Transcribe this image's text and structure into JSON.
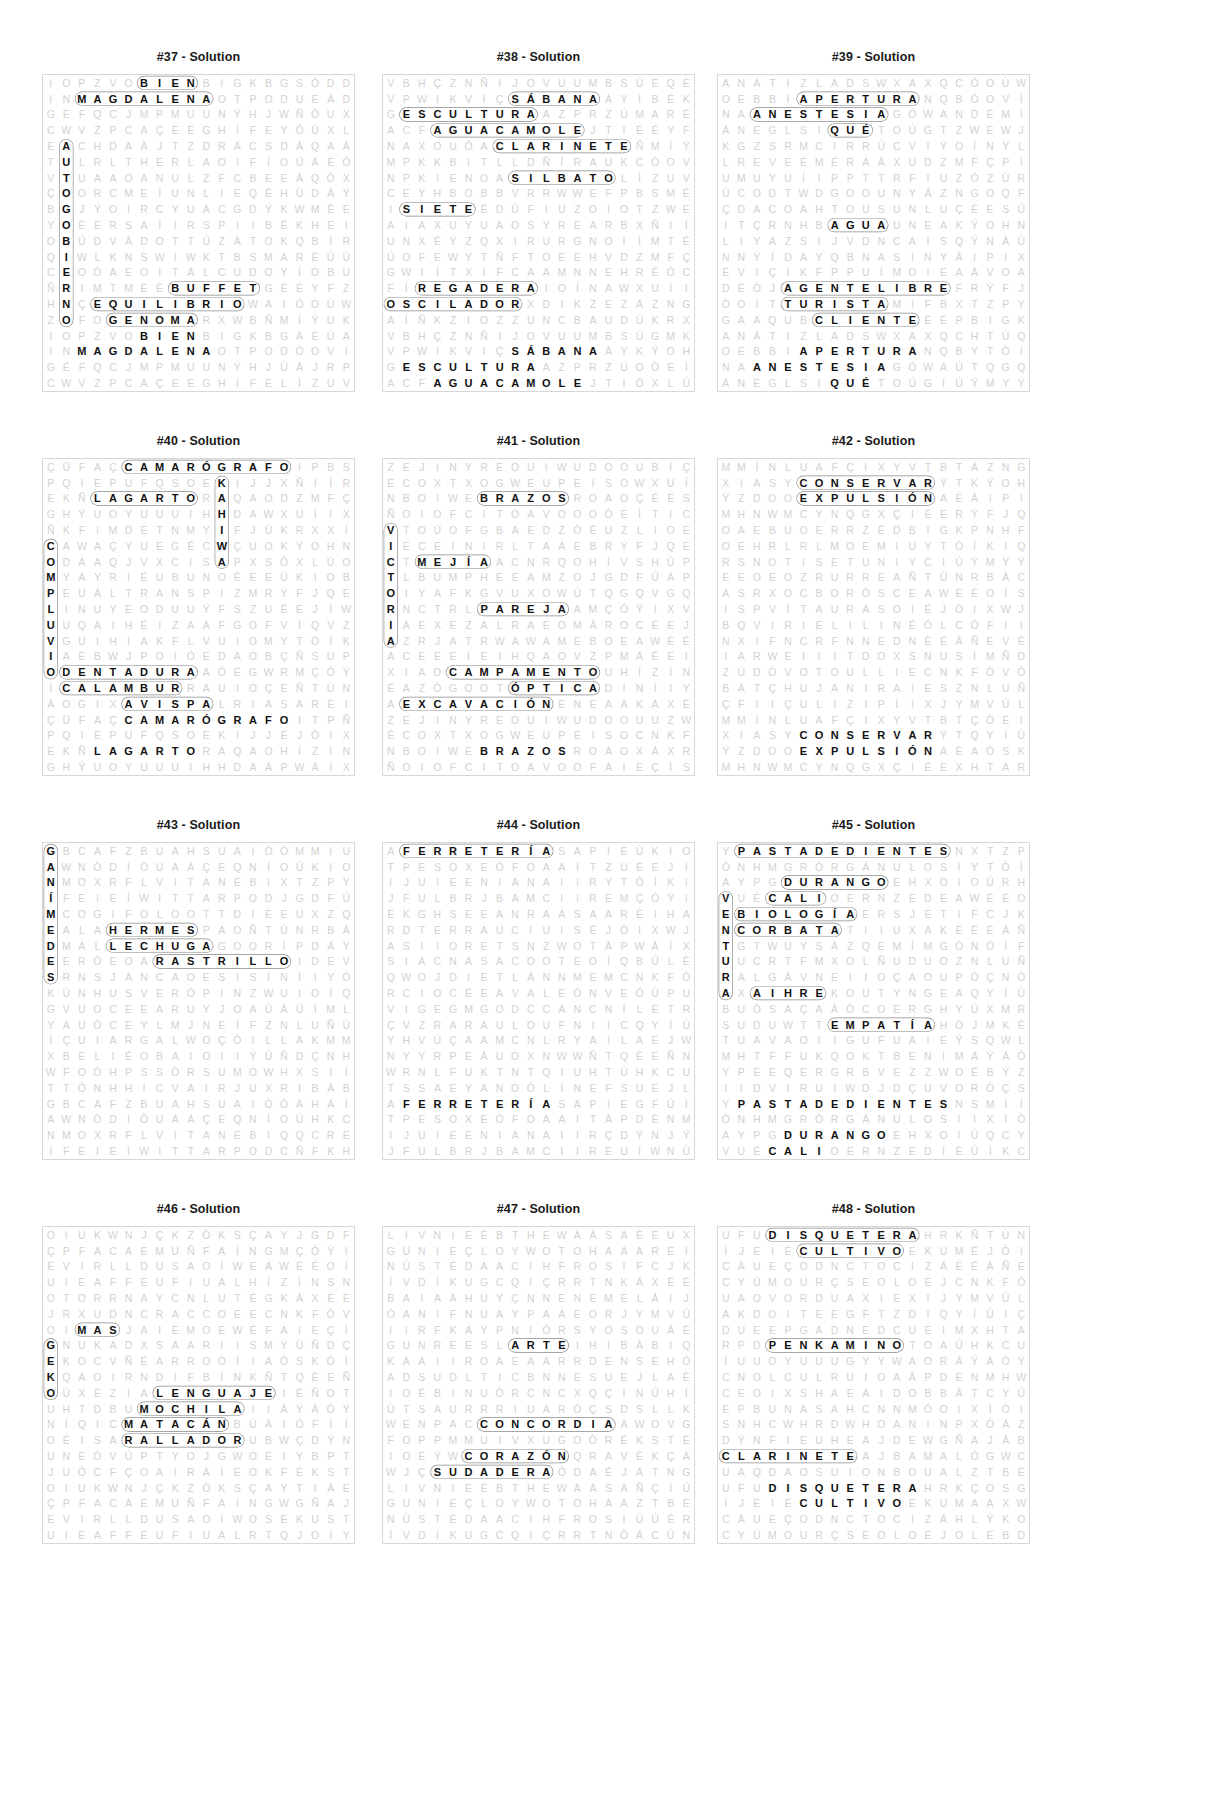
{
  "page": {
    "kind": "word-search-solutions",
    "title_suffix": "Solution",
    "grid_cols": 20,
    "grid_rows": 20,
    "colors": {
      "letter": "#111111",
      "filler": "#d2d2d2",
      "border": "#d7d7d7",
      "ring": "#8a8a8a"
    }
  },
  "puzzles": [
    {
      "id": "37",
      "title": "#37 - Solution",
      "rows": [
        "IOPZVOBIENBIGKBG",
        "INMAGDALENAOTPOD",
        "GÉFQCJMPMUUNÝHJ",
        "CWVZPCAÇEEGHÍFE",
        "EACHDAÀJTZDRÁCSD",
        "TULRLTHERLAOIF",
        "VTUAAOANULZF",
        "ÇOORCMEÍUNLI",
        "BGJÝOIRCYUAC",
        "YOÉERSAÍIRSPI",
        "OBÚDVÀDOTTÚZÀTO",
        "QIWLKNSWIWKTBS",
        "CEOÒAEOITÁLCUD",
        "ÑRIMTMÈÈBUFFETG",
        "HNÇEQUILIBRIOWAI",
        "ZOFOGENOMARXWB"
      ],
      "words": [
        "BIEN",
        "MAGDALENA",
        "BUFFET",
        "EQUILIBRIO",
        "GENOMA",
        "AUTOGOBIERNO",
        "RETRAER",
        "CUADRO",
        "DOTE",
        "ASIMETRIA",
        "NULO",
        "ENCIMA"
      ]
    },
    {
      "id": "38",
      "title": "#38 - Solution",
      "rows": [
        "VBHÇZNÑIJOVUUMBSÚ",
        "VPWIKVIÇSÁBANAÀY",
        "GESCULTURAAZPRZÚ",
        "ACFAGUACAMOLEJTI",
        "NAXOUÒACLARINETE",
        "MPKKBITLLDÑÎRAUKC",
        "NPKIENOASILBATO",
        "CEÝHBOBBVRRWWEF",
        "ISIETEÉDÚFIUZOIO",
        "AIAXUYUAOSYREARB",
        "UNXÉÝZQXIRURGNOI",
        "ÚOFEWYTÑFTOEEHV",
        "GWIÍTXÍFCAAMNNE",
        "FÍREGADERAIOÍNA",
        "OSCILADORXDIKZEZ",
        "AÍÑKZIOZZUNCBAUD"
      ],
      "words": [
        "SÁBANA",
        "ESCULTURA",
        "AGUACAMOLE",
        "CLARINETE",
        "SILBATO",
        "SIETE",
        "REGADERA",
        "OSCILADOR",
        "GANANCIA",
        "CAMPESINO",
        "EDIFICIOS",
        "BOBO",
        "BITER"
      ]
    },
    {
      "id": "39",
      "title": "#39 - Solution",
      "rows": [
        "ANÀTIZLADSWXAXQC",
        "OEBBIAPERTURANQB",
        "NAANESTESIAGÓWA",
        "ÁNEGLSIQUÉTOÚG",
        "KGZSRMCIRRÚCVI",
        "LREVEÉMÉRAÀXU",
        "UMUYUÍIPPTTRFI",
        "ÚCODTWDGOOUNY",
        "ÇDACOAHTOUSUNLU",
        "ITÇRNHBAGUAUNEA",
        "LIYAZSIJVDNCAIS",
        "NNÝÍDAYQBNASINY",
        "ÉVIÇÍKFPPUÍMOIE",
        "DÈÒJAGENTELIBREF",
        "ÒOÍTTURISTAMIFB",
        "GAAQUBCLIENTEÈÉP"
      ],
      "words": [
        "APERTURA",
        "ANESTESIA",
        "QUÉ",
        "AGUA",
        "AGENTELIBRE",
        "TURISTA",
        "CLIENTE",
        "GRUTAS",
        "ERRADICAR",
        "EXPEDICIÓN",
        "GASODUCTO"
      ]
    },
    {
      "id": "40",
      "title": "#40 - Solution",
      "rows": [
        "ÇÜFAÇCAMARÓGRAFOI",
        "PQIEPUFQSOEKIJJ",
        "EKÑLAGARTORAQAO",
        "GHÝUOYUUUIHHDA",
        "ÑKFIMDETNMYIFJ",
        "CAWAÇYUEGÉCWÇUO",
        "ODAAQJVXCISAPXS",
        "MYAYRIÉUBUNOÉEE",
        "PEUÁLTRANSPIZM",
        "LINUYEODUUÝFS",
        "UUQAIHÉIZAAFGO",
        "VGUIHIAKFLVUIOM",
        "IAÉBWJPOIÓEDAOB",
        "ODENTADURAAÓÉGWR",
        "ÍCALAMBURRAUIOÇE",
        "ÀOGIXAVISPALRIAS"
      ],
      "words": [
        "CAMARÓGRAFO",
        "LAGARTO",
        "DENTADURA",
        "CALAMBUR",
        "AVISPA",
        "COMPLUVIO",
        "AUNQUE",
        "KAHIWA",
        "INCIDENCIA",
        "TRANSE",
        "SUAVE",
        "LARGO",
        "EMBRAGUES"
      ]
    },
    {
      "id": "41",
      "title": "#41 - Solution",
      "rows": [
        "ZEJINYREOUIWUDOOU",
        "ÉCOXTXOGWEUPEISO",
        "NBOIWEBRAZOSROAO",
        "ÑOIOFCITOAVOO",
        "VTOÚOFGBAEDZ",
        "IECEINIRLTAAEB",
        "CTMEJÍAACNRQOH",
        "TLBUMPHEEAMZO",
        "OIYAFKGVUXOW",
        "RNCTRLPAREJAA",
        "IAEXEZALRAEOM",
        "AZRJATRWAWAMEBO",
        "ACEEEÍEIHQAOV",
        "XIADCAMPAMENTOU",
        "ÉAZÒGOOTÓPTICAD",
        "AEXCAVACIÓNENEAA"
      ],
      "words": [
        "BRAZOS",
        "MEJÍA",
        "PAREJA",
        "CAMPAMENTO",
        "ÓPTICA",
        "EXCAVACIÓN",
        "VICTORIA",
        "BUFETE",
        "OPOSICIÓN",
        "CENTRAL",
        "ENTREGA"
      ]
    },
    {
      "id": "42",
      "title": "#42 - Solution",
      "rows": [
        "MMÍNLUAFÇIXYVTBT",
        "XIASYCONSERVARÝT",
        "ÝZDOOEXPULSIÓNAÈ",
        "MHNWMCYNQGXÇIÉE",
        "OAEBUOERRZÉD",
        "OÉHRLRLMOEMIU",
        "RSNOTISETUNIYC",
        "EEOEOZRURREA",
        "ASRXOCBORÒSC",
        "ISPVÍTAURASOI",
        "BQVIRIELILINÉÓ",
        "NXIFNCRFNNEDN",
        "IARWEIIITDOX",
        "ZÚDÓVOTOULLIE",
        "BÀTÇHUJANIRAIES",
        "ÇFIIÇULIZIPÍIX"
      ],
      "words": [
        "CONSERVAR",
        "EXPULSIÓN",
        "EDUCACIÓN",
        "SOBREVIVIR",
        "TERCERO",
        "NUTRIENTE",
        "EXTRAORDINARIO",
        "MAYOR"
      ]
    },
    {
      "id": "43",
      "title": "#43 - Solution",
      "rows": [
        "GBCAFZBUAHSUAIÒÒ",
        "AWNÒDIÒUAÀÇEQNÍO",
        "NMOXRFLVITANEBI",
        "ÍFEIEÍWITTARPOD",
        "MCOGIFOLOOTTDI",
        "EALAHERMESPAO",
        "DMALLECHUGAGOO",
        "EERÒEOARASTRILLOI",
        "SRNSJANCAOESIS",
        "KÚNHUSVERÓPINZWUI",
        "GVUOCEEARUYJO",
        "YAUÒCEYLMJNEÍF",
        "ÍÇUIARGALWOÇÒI",
        "XBELIÉOBAIOII",
        "WFOÒHPSSÒRSUMO",
        "TTÒNHHÍCVAIRJUXR"
      ],
      "words": [
        "HERMES",
        "LECHUGA",
        "RASTRILLO",
        "HACER",
        "GANÍMEDES",
        "FLACO",
        "CAMARERO",
        "SUPERFICIAL",
        "EUROPA",
        "DIAGONALES",
        "SARGENTO"
      ]
    },
    {
      "id": "44",
      "title": "#44 - Solution",
      "rows": [
        "AFERRETERÍASAPIE",
        "TPESOXEÒFOAAIT",
        "IJUIEENIANAIIR",
        "JFULBRJBAMCIIRE",
        "EKGHSEEANRAASA",
        "RDTERRAUCIUIS",
        "ASIIORETSNZWOT",
        "SIACNASACOOTE",
        "QWOJDIETLÁNNMEM",
        "RCIOCÉEAVALEÓNVE",
        "VIGEGMGODCCANCN",
        "ÇVZRARAULOUFNIIC",
        "YHVÚÇAAMCNLRYAILA",
        "NYYRPEÁUOXNWW",
        "WRNLFUKTNTQIUHT",
        "TSSAEYANOÒLÍNEF"
      ],
      "words": [
        "FERRETERÍA",
        "ARTE",
        "CONCORDIA",
        "ANDAMIO",
        "CREATIVA",
        "DISTANCIA",
        "NECESIDAD",
        "INTERIOR",
        "LATENCIA"
      ]
    },
    {
      "id": "45",
      "title": "#45 - Solution",
      "rows": [
        "YPASTADEDIENTESN",
        "ÒNHMGRÒRGÁNULOSI",
        "AYPGDURANGOEHXOI",
        "VUÉCALIOERNZED",
        "EBIOLOGÍAERSJETI",
        "NCORBATATIIUXAKE",
        "TGTWUYSÀZQEMÍMG",
        "UUCRTFMXOLÑUDUO",
        "RALGÁVNEIIOÇAOU",
        "AXAIHREKOUTYNGEA",
        "BUÒSAÇAÀÒCOER",
        "SUDUWTTEMPATÍA",
        "TUAVAOIIGUFUAIE",
        "MHTFFUKQOKTBENIM",
        "YPÉEQERGRBVEZZWO",
        "IIDVIRUIWDJDÇUVO"
      ],
      "words": [
        "PASTADEDIENTES",
        "ORGÁNULOS",
        "DURANGO",
        "CALI",
        "BIOLOGÍA",
        "CORBATA",
        "EMPATÍA",
        "DIEGO",
        "NATURALEZA",
        "VENTURA",
        "GALÁN",
        "AIHRE"
      ]
    },
    {
      "id": "46",
      "title": "#46 - Solution",
      "rows": [
        "OIUKWNJÇKZÒKSÇAY",
        "ÇPFACAEMUÑFAÍNG",
        "EVIRLLDUSAOÍW",
        "UIEAFFEUFIUAL",
        "OTORRNAYCNLUTÉG",
        "JRXUDNCRACCOEE",
        "OIMASJAIEMOEWÉ",
        "GNUKADXSAARIISM",
        "EKOCVÑÉARROÒÍI",
        "KQAOIRNDIFBÍNK",
        "OÙXÉZIALENGUAJEI",
        "UHTDBUMOCHILAII",
        "NÍQICMATACÁNBÙÀI",
        "OÉISARALLADORUBW",
        "UNEÒVÙPTYOJGWOÉI",
        "JUÒCFÇOAIRÀÍEOKF"
      ],
      "words": [
        "MAS",
        "LENGUAJE",
        "MOCHILA",
        "MATACÁN",
        "RALLADOR",
        "VITRINA",
        "GEKO",
        "PREFERENCIAS",
        "ACCIONES",
        "MUNDO",
        "CALDEAR"
      ]
    },
    {
      "id": "47",
      "title": "#47 - Solution",
      "rows": [
        "LIVNIEÉBTHEWÀÀSA",
        "GUNIEÇLOYWOTOHAA",
        "NÙSTÉDAACIHFROSI",
        "ÍVDÍKUGCQIÇRRTN",
        "BAIAÀHUYÇNNENEM",
        "ÒANIFNUAYPAAEOR",
        "IIRFKAÝPNIÒRSYOS",
        "GUNREESLARTEIH",
        "KAAIIROAEAARRDE",
        "ADSUDLTICBNNE",
        "IOÉBINUÒRCNC",
        "ÙTSAURRRIUA",
        "WENPACCONCORDIAA",
        "FOPPMMUIVXUGOÒR",
        "IOÉÝWCORAZÓNQRA",
        "WJÇSUDADERAÒDAÉJ"
      ],
      "words": [
        "ARTE",
        "CONCORDIA",
        "CORAZÓN",
        "SUDADERA",
        "BLAGUNA",
        "ANIVERSARIO",
        "DISCURSO",
        "TRANSPORTE"
      ]
    },
    {
      "id": "48",
      "title": "#48 - Solution",
      "rows": [
        "UFUDISQUETERAHRK",
        "ÍJEIÉCULTIVOEKUM",
        "CÀUEÇODNCTOCIZÁ",
        "CYÚMOURÇSEOLOEJ",
        "UAOVORDUAXIEXI",
        "AKDOITEEGFTZDI",
        "DUEEPGADNEDCUEIM",
        "RPDPENKAMINOTOA",
        "ÍUUOYUUUGYYWAOR",
        "CNOLCULRUIOA",
        "CEOIXSHAEAIDO",
        "EPBUNASAHCNNMÓO",
        "SNHCWHRDWHOANIN",
        "DÝNFIEUHEAJDE",
        "CLARINETEAJBAMAL",
        "UAQDAOSUIONBOUAL"
      ],
      "words": [
        "DISQUETERA",
        "CULTIVO",
        "PENKAMINO",
        "CLARINETE",
        "EXCITACIÓN",
        "MORADO",
        "ADOLESCENCIA",
        "VODKA"
      ]
    }
  ]
}
